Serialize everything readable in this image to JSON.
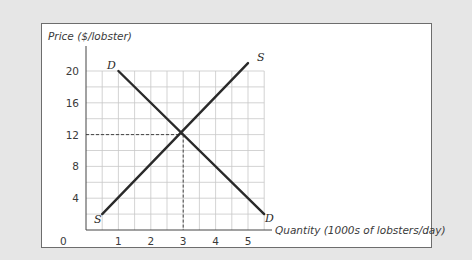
{
  "chart_data": {
    "type": "line",
    "title": "",
    "xlabel": "Quantity (1000s of lobsters/day)",
    "ylabel": "Price ($/lobster)",
    "x_ticks": [
      "0",
      "1",
      "2",
      "3",
      "4",
      "5"
    ],
    "y_ticks": [
      "4",
      "8",
      "12",
      "16",
      "20"
    ],
    "xlim": [
      0,
      5.5
    ],
    "ylim": [
      0,
      22
    ],
    "grid": true,
    "grid_step": {
      "x": 0.5,
      "y": 2
    },
    "series": [
      {
        "name": "S",
        "label_start": "S",
        "label_end": "S",
        "x": [
          0.5,
          5
        ],
        "y": [
          2,
          21
        ]
      },
      {
        "name": "D",
        "label_start": "D",
        "label_end": "D",
        "x": [
          1,
          5.5
        ],
        "y": [
          20,
          2
        ]
      }
    ],
    "equilibrium": {
      "quantity": 3,
      "price": 12,
      "guide_lines": "dashed"
    },
    "colors": {
      "background": "#e6e6e6",
      "panel": "#ffffff",
      "curve": "#2a2a2a",
      "grid": "#c8c8c8"
    }
  },
  "labels": {
    "ylabel": "Price ($/lobster)",
    "xlabel": "Quantity (1000s of lobsters/day)",
    "origin": "0",
    "supply_top": "S",
    "supply_bottom": "S",
    "demand_top": "D",
    "demand_bottom": "D"
  }
}
